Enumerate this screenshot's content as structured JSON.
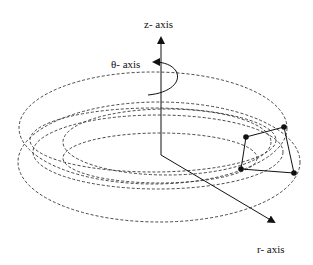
{
  "diagram": {
    "title": "",
    "labels": {
      "z_axis": "z- axis",
      "theta_axis": "θ- axis",
      "r_axis": "r- axis"
    },
    "axes": {
      "origin": [
        161,
        155
      ],
      "z_axis_tip": [
        161,
        35
      ],
      "r_axis_tip": [
        276,
        223
      ]
    },
    "orbits": {
      "style": "dashed",
      "count": 6
    },
    "element": {
      "shape": "quadrilateral",
      "nodes": [
        [
          246,
          137
        ],
        [
          284,
          127
        ],
        [
          294,
          173
        ],
        [
          241,
          169
        ]
      ]
    },
    "colors": {
      "line": "#111111",
      "dashed": "#333333",
      "background": "#ffffff"
    }
  }
}
